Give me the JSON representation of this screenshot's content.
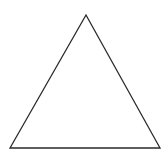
{
  "diagram": {
    "shape": "triangle",
    "stroke_color": "#2a2a2a",
    "fill_color": "#ffffff",
    "stroke_width": 1.3,
    "vertices": {
      "apex": [
        86,
        15
      ],
      "bottom_left": [
        10,
        148
      ],
      "bottom_right": [
        160,
        148
      ]
    }
  }
}
